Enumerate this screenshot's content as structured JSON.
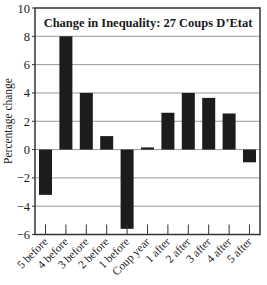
{
  "chart_data": {
    "type": "bar",
    "title": "Change in Inequality: 27 Coups D’Etat",
    "xlabel": "",
    "ylabel": "Percentage change",
    "categories": [
      "5 before",
      "4 before",
      "3 before",
      "2 before",
      "1 before",
      "Coup year",
      "1 after",
      "2 after",
      "3 after",
      "4 after",
      "5 after"
    ],
    "values": [
      -3.2,
      8.0,
      4.0,
      0.95,
      -5.6,
      0.15,
      2.6,
      4.0,
      3.65,
      2.55,
      -0.9
    ],
    "ylim": [
      -6,
      10
    ],
    "yticks": [
      -6,
      -4,
      -2,
      0,
      2,
      4,
      6,
      8,
      10
    ],
    "ytick_labels": [
      "−6",
      "−4",
      "−2",
      "0",
      "2",
      "4",
      "6",
      "8",
      "10"
    ],
    "grid": true,
    "legend": null,
    "bar_color": "#1c1c1c",
    "grid_color": "#9a9a9a",
    "axis_color": "#333333"
  }
}
